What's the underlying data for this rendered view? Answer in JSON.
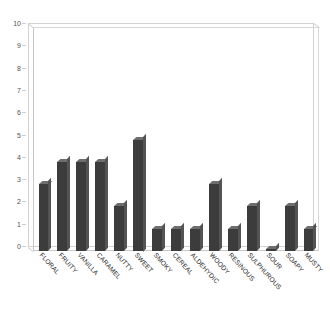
{
  "chart_data": {
    "type": "bar",
    "title": "",
    "subtitle": "",
    "xlabel": "",
    "ylabel": "",
    "ylim": [
      0,
      10
    ],
    "ytick_step": 1,
    "yticks": [
      0,
      1,
      2,
      3,
      4,
      5,
      6,
      7,
      8,
      9,
      10
    ],
    "grid": false,
    "legend": null,
    "legend_position": "none",
    "style": "3d-bar",
    "bar_color": "#3c3c3c",
    "bar_top_color": "#6e6e6e",
    "bar_side_color": "#545454",
    "frame_color": "#cccccc",
    "background_color": "#ffffff",
    "categories": [
      "FLORAL",
      "FRUITY",
      "VANILLA",
      "CARAMEL",
      "NUTTY",
      "SWEET",
      "SMOKY",
      "CEREAL",
      "ALDEHYDIC",
      "WOODY",
      "RESINOUS",
      "SULPHUROUS",
      "SOUR",
      "SOAPY",
      "MUSTY"
    ],
    "values": [
      3,
      4,
      4,
      4,
      2,
      5,
      1,
      1,
      1,
      3,
      1,
      2,
      0.08,
      2,
      1
    ]
  }
}
